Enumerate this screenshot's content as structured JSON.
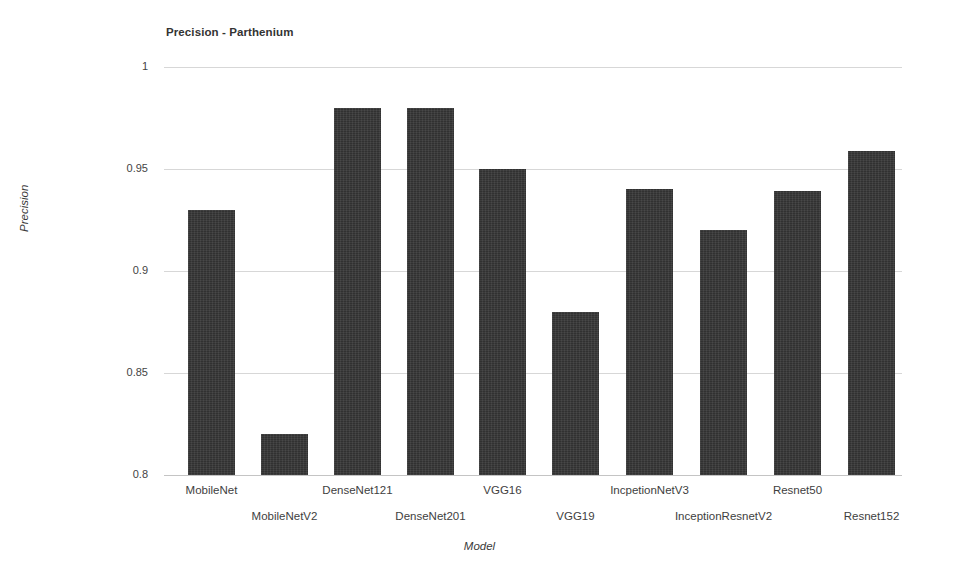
{
  "chart_data": {
    "type": "bar",
    "title": "Precision - Parthenium",
    "xlabel": "Model",
    "ylabel": "Precision",
    "ylim": [
      0.8,
      1.0
    ],
    "yticks": [
      "1",
      "0.95",
      "0.9",
      "0.85",
      "0.8"
    ],
    "ytick_values": [
      1,
      0.95,
      0.9,
      0.85,
      0.8
    ],
    "grid": true,
    "legend": "none",
    "bar_color": "#363636",
    "background_color": "#ffffff",
    "categories": [
      "MobileNet",
      "MobileNetV2",
      "DenseNet121",
      "DenseNet201",
      "VGG16",
      "VGG19",
      "IncpetionNetV3",
      "InceptionResnetV2",
      "Resnet50",
      "Resnet152"
    ],
    "values": [
      0.93,
      0.82,
      0.98,
      0.98,
      0.95,
      0.88,
      0.94,
      0.92,
      0.939,
      0.959
    ],
    "series": [
      {
        "name": "Precision",
        "values": [
          0.93,
          0.82,
          0.98,
          0.98,
          0.95,
          0.88,
          0.94,
          0.92,
          0.939,
          0.959
        ]
      }
    ]
  },
  "bars": [
    {
      "label": "MobileNet",
      "value": 0.93,
      "x": 188,
      "width": 47,
      "label_row": "a"
    },
    {
      "label": "MobileNetV2",
      "value": 0.82,
      "x": 261,
      "width": 47,
      "label_row": "b"
    },
    {
      "label": "DenseNet121",
      "value": 0.98,
      "x": 334,
      "width": 47,
      "label_row": "a"
    },
    {
      "label": "DenseNet201",
      "value": 0.98,
      "x": 407,
      "width": 47,
      "label_row": "b"
    },
    {
      "label": "VGG16",
      "value": 0.95,
      "x": 479,
      "width": 47,
      "label_row": "a"
    },
    {
      "label": "VGG19",
      "value": 0.88,
      "x": 552,
      "width": 47,
      "label_row": "b"
    },
    {
      "label": "IncpetionNetV3",
      "value": 0.94,
      "x": 626,
      "width": 47,
      "label_row": "a"
    },
    {
      "label": "InceptionResnetV2",
      "value": 0.92,
      "x": 700,
      "width": 47,
      "label_row": "b"
    },
    {
      "label": "Resnet50",
      "value": 0.939,
      "x": 774,
      "width": 47,
      "label_row": "a"
    },
    {
      "label": "Resnet152",
      "value": 0.959,
      "x": 848,
      "width": 47,
      "label_row": "b"
    }
  ]
}
